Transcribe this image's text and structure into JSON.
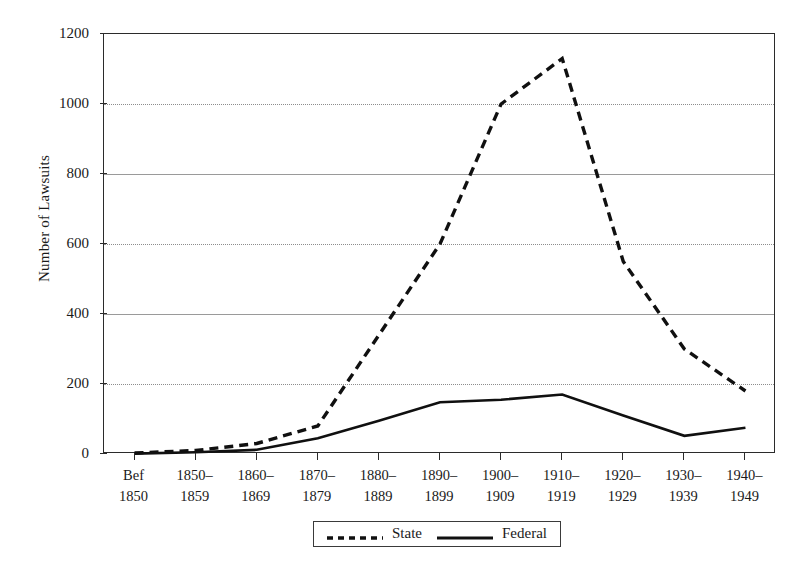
{
  "axes": {
    "ylabel": "Number of Lawsuits",
    "yticks": [
      "0",
      "200",
      "400",
      "600",
      "800",
      "1000",
      "1200"
    ]
  },
  "legend": {
    "items": [
      {
        "label": "State",
        "style": "dashed",
        "color": "#1a1a1a"
      },
      {
        "label": "Federal",
        "style": "solid",
        "color": "#1a1a1a"
      }
    ]
  },
  "chart_data": {
    "type": "line",
    "title": "",
    "xlabel": "",
    "ylabel": "Number of Lawsuits",
    "ylim": [
      0,
      1200
    ],
    "yticks": [
      0,
      200,
      400,
      600,
      800,
      1000,
      1200
    ],
    "grid": true,
    "legend_position": "bottom",
    "categories": [
      "Bef 1850",
      "1850–1859",
      "1860–1869",
      "1870–1879",
      "1880–1889",
      "1890–1899",
      "1900–1909",
      "1910–1919",
      "1920–1929",
      "1930–1939",
      "1940–1949"
    ],
    "category_lines": [
      [
        "Bef",
        "1850"
      ],
      [
        "1850–",
        "1859"
      ],
      [
        "1860–",
        "1869"
      ],
      [
        "1870–",
        "1879"
      ],
      [
        "1880–",
        "1889"
      ],
      [
        "1890–",
        "1899"
      ],
      [
        "1900–",
        "1909"
      ],
      [
        "1910–",
        "1919"
      ],
      [
        "1920–",
        "1929"
      ],
      [
        "1930–",
        "1939"
      ],
      [
        "1940–",
        "1949"
      ]
    ],
    "series": [
      {
        "name": "State",
        "style": "dashed",
        "values": [
          3,
          10,
          30,
          80,
          340,
          600,
          1000,
          1130,
          550,
          300,
          180
        ]
      },
      {
        "name": "Federal",
        "style": "solid",
        "values": [
          1,
          5,
          12,
          45,
          95,
          148,
          155,
          170,
          110,
          52,
          75
        ]
      }
    ]
  }
}
